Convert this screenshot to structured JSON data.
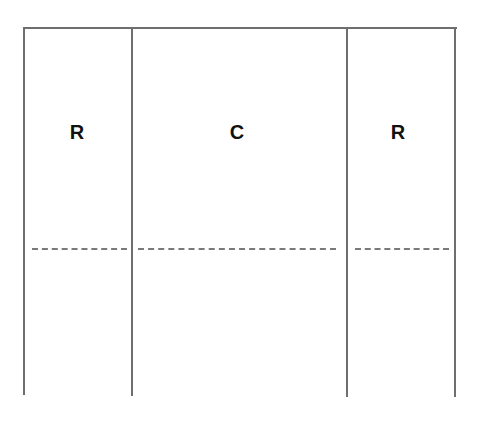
{
  "diagram": {
    "regions": [
      {
        "id": "left",
        "label": "R"
      },
      {
        "id": "center",
        "label": "C"
      },
      {
        "id": "right",
        "label": "R"
      }
    ],
    "colors": {
      "line": "#6e6e6e",
      "dash": "#7a7a7a",
      "text": "#111111"
    }
  }
}
